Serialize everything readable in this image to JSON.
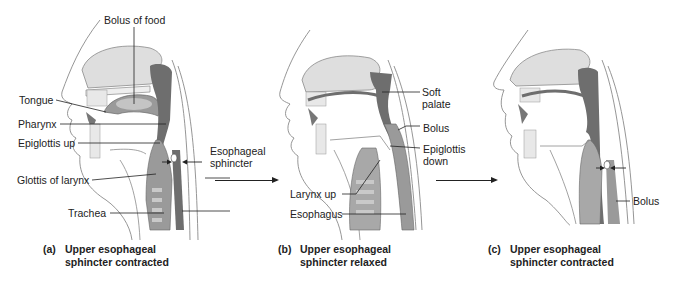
{
  "figure": {
    "panels": [
      {
        "id": "a",
        "caption_letter": "(a)",
        "caption_line1": "Upper esophageal",
        "caption_line2": "sphincter contracted",
        "labels": {
          "bolus_of_food": "Bolus of food",
          "tongue": "Tongue",
          "pharynx": "Pharynx",
          "epiglottis_up": "Epiglottis up",
          "glottis_of_larynx": "Glottis of larynx",
          "trachea": "Trachea"
        }
      },
      {
        "id": "b",
        "caption_letter": "(b)",
        "caption_line1": "Upper esophageal",
        "caption_line2": "sphincter relaxed",
        "labels": {
          "esophageal_sphincter_line1": "Esophageal",
          "esophageal_sphincter_line2": "sphincter",
          "soft_palate_line1": "Soft",
          "soft_palate_line2": "palate",
          "bolus": "Bolus",
          "epiglottis_down_line1": "Epiglottis",
          "epiglottis_down_line2": "down",
          "larynx_up": "Larynx up",
          "esophagus": "Esophagus"
        }
      },
      {
        "id": "c",
        "caption_letter": "(c)",
        "caption_line1": "Upper esophageal",
        "caption_line2": "sphincter contracted",
        "labels": {
          "bolus": "Bolus"
        }
      }
    ],
    "colors": {
      "line": "#222222",
      "tissue_dark": "#6e6e6e",
      "tissue_mid": "#9a9a9a",
      "tissue_light": "#d9d9d9",
      "outline": "#8a8a8a"
    }
  }
}
